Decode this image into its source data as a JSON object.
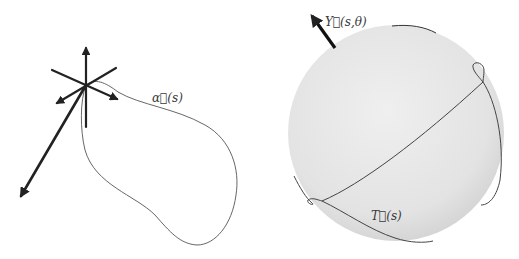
{
  "figure": {
    "left_panel": {
      "name": "space-curve-with-frame",
      "curve_label": "α⃗(s)",
      "curve_color": "#555555",
      "frame_color": "#222222"
    },
    "right_panel": {
      "name": "unit-sphere-tangent-indicatrix",
      "vector_label": "Y⃗(s,θ)",
      "curve_label": "T⃗(s)",
      "sphere_color": "#e6e6e6",
      "curve_color": "#444444"
    }
  }
}
